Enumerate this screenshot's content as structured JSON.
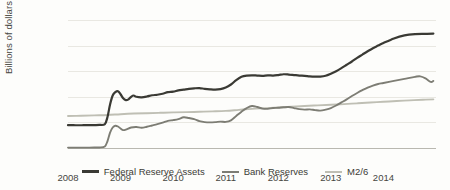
{
  "chart_data": {
    "type": "line",
    "title": "",
    "xlabel": "",
    "ylabel": "Billions of dollars",
    "ylim": [
      0,
      5000
    ],
    "xlim": [
      2008,
      2015
    ],
    "grid": true,
    "legend_position": "bottom",
    "y_ticks": [
      "0",
      "1,000",
      "2,000",
      "3,000",
      "4,000",
      "5,000"
    ],
    "y_tick_values": [
      0,
      1000,
      2000,
      3000,
      4000,
      5000
    ],
    "x_ticks": [
      "2008",
      "2009",
      "2010",
      "2011",
      "2012",
      "2013",
      "2014"
    ],
    "x_tick_values": [
      2008,
      2009,
      2010,
      2011,
      2012,
      2013,
      2014
    ],
    "colors": {
      "federal_reserve_assets": "#3a3a34",
      "bank_reserves": "#7d7d74",
      "m2_over_6": "#bfbfb4",
      "gridline": "#e9e8e2",
      "baseline": "#b9b8b0",
      "text": "#46463f",
      "background": "#fdfdfb"
    },
    "series": [
      {
        "name": "Federal Reserve Assets",
        "color": "#3a3a34",
        "x": [
          2008.0,
          2008.1,
          2008.2,
          2008.3,
          2008.4,
          2008.5,
          2008.6,
          2008.7,
          2008.75,
          2008.8,
          2008.85,
          2008.9,
          2008.95,
          2009.0,
          2009.05,
          2009.1,
          2009.15,
          2009.2,
          2009.25,
          2009.3,
          2009.4,
          2009.5,
          2009.6,
          2009.7,
          2009.8,
          2009.9,
          2010.0,
          2010.1,
          2010.2,
          2010.3,
          2010.4,
          2010.5,
          2010.6,
          2010.7,
          2010.8,
          2010.9,
          2011.0,
          2011.1,
          2011.2,
          2011.3,
          2011.4,
          2011.5,
          2011.6,
          2011.7,
          2011.8,
          2011.9,
          2012.0,
          2012.1,
          2012.2,
          2012.3,
          2012.4,
          2012.5,
          2012.6,
          2012.7,
          2012.8,
          2012.9,
          2013.0,
          2013.1,
          2013.2,
          2013.3,
          2013.4,
          2013.5,
          2013.6,
          2013.7,
          2013.8,
          2013.9,
          2014.0,
          2014.2,
          2014.4,
          2014.6,
          2014.8,
          2014.95
        ],
        "y": [
          890,
          890,
          888,
          890,
          892,
          895,
          900,
          930,
          1200,
          1700,
          2050,
          2180,
          2220,
          2100,
          1940,
          1870,
          1900,
          2000,
          2050,
          2000,
          1980,
          2010,
          2060,
          2080,
          2120,
          2180,
          2200,
          2250,
          2280,
          2310,
          2330,
          2340,
          2310,
          2290,
          2280,
          2300,
          2360,
          2480,
          2650,
          2780,
          2830,
          2840,
          2830,
          2820,
          2840,
          2830,
          2850,
          2880,
          2870,
          2850,
          2830,
          2820,
          2800,
          2790,
          2790,
          2820,
          2900,
          3000,
          3120,
          3250,
          3380,
          3520,
          3650,
          3780,
          3900,
          4000,
          4100,
          4280,
          4400,
          4450,
          4460,
          4470
        ]
      },
      {
        "name": "Bank Reserves",
        "color": "#7d7d74",
        "x": [
          2008.0,
          2008.1,
          2008.2,
          2008.3,
          2008.4,
          2008.5,
          2008.6,
          2008.7,
          2008.75,
          2008.8,
          2008.85,
          2008.9,
          2008.95,
          2009.0,
          2009.05,
          2009.1,
          2009.2,
          2009.3,
          2009.4,
          2009.5,
          2009.6,
          2009.7,
          2009.8,
          2009.9,
          2010.0,
          2010.1,
          2010.2,
          2010.3,
          2010.4,
          2010.5,
          2010.6,
          2010.7,
          2010.8,
          2010.9,
          2011.0,
          2011.1,
          2011.2,
          2011.3,
          2011.4,
          2011.5,
          2011.6,
          2011.7,
          2011.8,
          2011.9,
          2012.0,
          2012.1,
          2012.2,
          2012.3,
          2012.4,
          2012.5,
          2012.6,
          2012.7,
          2012.8,
          2012.9,
          2013.0,
          2013.1,
          2013.2,
          2013.3,
          2013.4,
          2013.5,
          2013.6,
          2013.7,
          2013.8,
          2013.9,
          2014.0,
          2014.2,
          2014.4,
          2014.6,
          2014.7,
          2014.8,
          2014.9,
          2014.95
        ],
        "y": [
          15,
          15,
          14,
          15,
          16,
          18,
          20,
          60,
          260,
          600,
          800,
          870,
          840,
          760,
          700,
          720,
          800,
          820,
          790,
          830,
          880,
          930,
          990,
          1060,
          1090,
          1130,
          1200,
          1170,
          1130,
          1050,
          1010,
          1000,
          1010,
          1030,
          1020,
          1080,
          1250,
          1420,
          1560,
          1640,
          1600,
          1540,
          1530,
          1560,
          1570,
          1590,
          1600,
          1560,
          1520,
          1500,
          1510,
          1480,
          1460,
          1500,
          1560,
          1660,
          1780,
          1900,
          2030,
          2150,
          2260,
          2360,
          2440,
          2500,
          2540,
          2620,
          2700,
          2780,
          2800,
          2720,
          2580,
          2620
        ]
      },
      {
        "name": "M2/6",
        "color": "#bfbfb4",
        "x": [
          2008.0,
          2008.25,
          2008.5,
          2008.75,
          2009.0,
          2009.25,
          2009.5,
          2009.75,
          2010.0,
          2010.25,
          2010.5,
          2010.75,
          2011.0,
          2011.25,
          2011.5,
          2011.75,
          2012.0,
          2012.25,
          2012.5,
          2012.75,
          2013.0,
          2013.25,
          2013.5,
          2013.75,
          2014.0,
          2014.25,
          2014.5,
          2014.75,
          2014.95
        ],
        "y": [
          1250,
          1260,
          1275,
          1290,
          1320,
          1345,
          1360,
          1375,
          1390,
          1400,
          1415,
          1430,
          1450,
          1490,
          1530,
          1555,
          1580,
          1610,
          1640,
          1665,
          1690,
          1715,
          1745,
          1775,
          1805,
          1835,
          1860,
          1885,
          1900
        ]
      }
    ]
  },
  "axis": {
    "y_title": "Billions of dollars"
  },
  "legend": {
    "items": [
      {
        "label": "Federal Reserve Assets",
        "color": "#3a3a34",
        "thickness": "2.2px"
      },
      {
        "label": "Bank Reserves",
        "color": "#7d7d74",
        "thickness": "2px"
      },
      {
        "label": "M2/6",
        "color": "#bfbfb4",
        "thickness": "2px"
      }
    ]
  }
}
